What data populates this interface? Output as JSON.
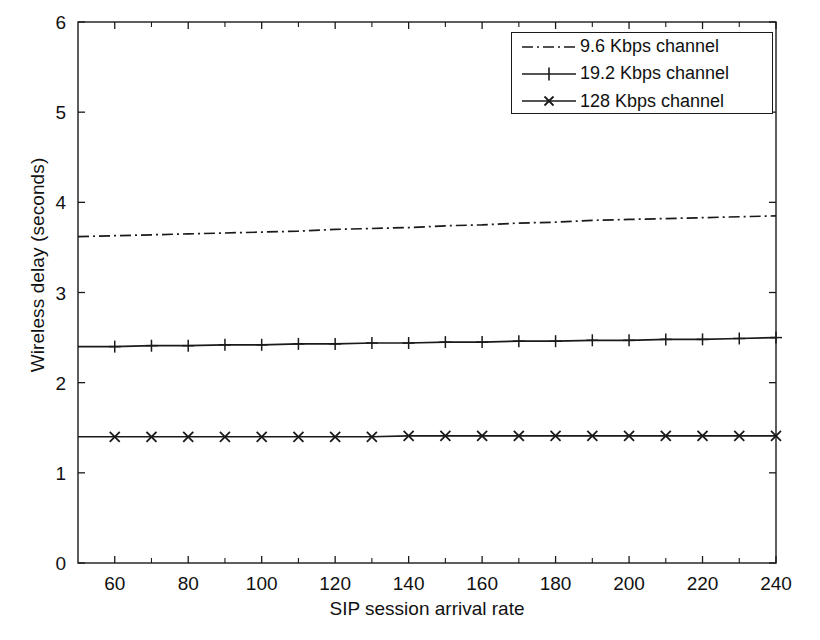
{
  "chart_data": {
    "type": "line",
    "title": "",
    "xlabel": "SIP session arrival rate",
    "ylabel": "Wireless delay (seconds)",
    "xlim": [
      50,
      240
    ],
    "ylim": [
      0,
      6
    ],
    "xticks": [
      60,
      80,
      100,
      120,
      140,
      160,
      180,
      200,
      220,
      240
    ],
    "xtick_labels": [
      "60",
      "80",
      "100",
      "120",
      "140",
      "160",
      "180",
      "200",
      "220",
      "240"
    ],
    "xticks_minor": [
      50,
      70,
      90,
      110,
      130,
      150,
      170,
      190,
      210,
      230
    ],
    "yticks": [
      0,
      1,
      2,
      3,
      4,
      5,
      6
    ],
    "ytick_labels": [
      "0",
      "1",
      "2",
      "3",
      "4",
      "5",
      "6"
    ],
    "grid": false,
    "legend_position": "top-right",
    "x": [
      50,
      60,
      70,
      80,
      90,
      100,
      110,
      120,
      130,
      140,
      150,
      160,
      170,
      180,
      190,
      200,
      210,
      220,
      230,
      240
    ],
    "series": [
      {
        "name": "9.6 Kbps channel",
        "linestyle": "dash-dot",
        "marker": "none",
        "color": "#1a1a1a",
        "values": [
          3.62,
          3.63,
          3.64,
          3.65,
          3.66,
          3.67,
          3.68,
          3.7,
          3.71,
          3.72,
          3.74,
          3.75,
          3.77,
          3.78,
          3.8,
          3.81,
          3.82,
          3.83,
          3.84,
          3.85
        ]
      },
      {
        "name": "19.2 Kbps channel",
        "linestyle": "solid",
        "marker": "plus",
        "color": "#1a1a1a",
        "values": [
          2.4,
          2.4,
          2.41,
          2.41,
          2.42,
          2.42,
          2.43,
          2.43,
          2.44,
          2.44,
          2.45,
          2.45,
          2.46,
          2.46,
          2.47,
          2.47,
          2.48,
          2.48,
          2.49,
          2.5
        ]
      },
      {
        "name": "128 Kbps channel",
        "linestyle": "solid",
        "marker": "cross",
        "color": "#1a1a1a",
        "values": [
          1.4,
          1.4,
          1.4,
          1.4,
          1.4,
          1.4,
          1.4,
          1.4,
          1.4,
          1.41,
          1.41,
          1.41,
          1.41,
          1.41,
          1.41,
          1.41,
          1.41,
          1.41,
          1.41,
          1.41
        ]
      }
    ]
  },
  "legend": {
    "entries": [
      {
        "label": "9.6 Kbps channel",
        "style": "dash-dot"
      },
      {
        "label": "19.2 Kbps channel",
        "style": "solid-plus"
      },
      {
        "label": "128 Kbps channel",
        "style": "solid-cross"
      }
    ]
  },
  "axes": {
    "x_title": "SIP session arrival rate",
    "y_title": "Wireless delay (seconds)"
  }
}
